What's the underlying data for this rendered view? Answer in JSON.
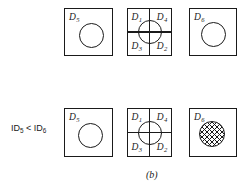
{
  "figure": {
    "caption": "(b)",
    "inequality": {
      "lhs_prefix": "ID",
      "lhs_sub": "5",
      "operator": "<",
      "rhs_prefix": "ID",
      "rhs_sub": "6"
    },
    "rows": [
      {
        "row_index": 1,
        "cells": [
          {
            "kind": "single-region",
            "label_prefix": "D",
            "label_sub": "5",
            "circle": "outline"
          },
          {
            "kind": "quadtree-region",
            "quadrants": [
              {
                "position": "top-left",
                "label_prefix": "D",
                "label_sub": "1"
              },
              {
                "position": "top-right",
                "label_prefix": "D",
                "label_sub": "4"
              },
              {
                "position": "bottom-left",
                "label_prefix": "D",
                "label_sub": "3"
              },
              {
                "position": "bottom-right",
                "label_prefix": "D",
                "label_sub": "2"
              }
            ],
            "circle": "outline"
          },
          {
            "kind": "single-region",
            "label_prefix": "D",
            "label_sub": "6",
            "circle": "outline"
          }
        ]
      },
      {
        "row_index": 2,
        "cells": [
          {
            "kind": "single-region",
            "label_prefix": "D",
            "label_sub": "5",
            "circle": "outline"
          },
          {
            "kind": "quadtree-region",
            "quadrants": [
              {
                "position": "top-left",
                "label_prefix": "D",
                "label_sub": "1"
              },
              {
                "position": "top-right",
                "label_prefix": "D",
                "label_sub": "4"
              },
              {
                "position": "bottom-left",
                "label_prefix": "D",
                "label_sub": "3"
              },
              {
                "position": "bottom-right",
                "label_prefix": "D",
                "label_sub": "2"
              }
            ],
            "circle": "outline"
          },
          {
            "kind": "single-region",
            "label_prefix": "D",
            "label_sub": "6",
            "circle": "cross-hatched"
          }
        ]
      }
    ],
    "colors": {
      "ink": "#1a1a1a",
      "background": "#ffffff"
    }
  }
}
